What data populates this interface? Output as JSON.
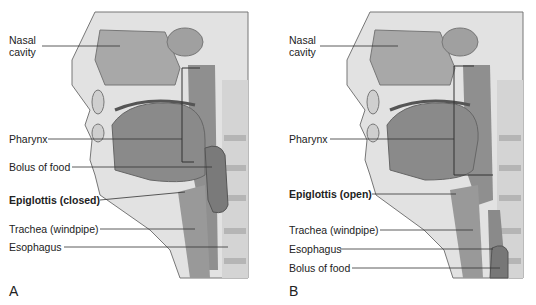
{
  "panels": [
    {
      "letter": "A",
      "labels": {
        "nasal_cavity_1": "Nasal",
        "nasal_cavity_2": "cavity",
        "pharynx": "Pharynx",
        "bolus": "Bolus of food",
        "epiglottis": "Epiglottis (closed)",
        "trachea": "Trachea (windpipe)",
        "esophagus": "Esophagus"
      }
    },
    {
      "letter": "B",
      "labels": {
        "nasal_cavity_1": "Nasal",
        "nasal_cavity_2": "cavity",
        "pharynx": "Pharynx",
        "epiglottis": "Epiglottis (open)",
        "trachea": "Trachea (windpipe)",
        "esophagus": "Esophagus",
        "bolus": "Bolus of food"
      }
    }
  ],
  "colors": {
    "tissue_dark": "#8a8a8a",
    "tissue_mid": "#a8a8a8",
    "tissue_light": "#d8d8d8",
    "bone": "#c8c8c8",
    "line": "#333333"
  }
}
